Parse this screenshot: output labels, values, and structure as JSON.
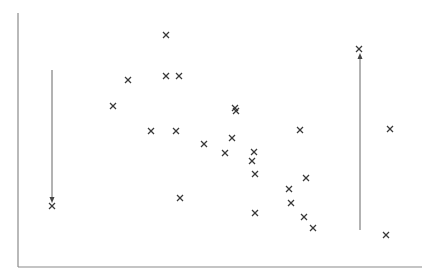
{
  "chart_data": {
    "type": "scatter",
    "title": "",
    "xlabel": "",
    "ylabel": "",
    "grid": false,
    "legend": null,
    "marker": "x",
    "marker_color": "#3a3a3a",
    "axis_color": "#8a8a8a",
    "pixel_frame": {
      "x_axis_y": 267,
      "y_axis_x": 18,
      "y_axis_top": 13,
      "x_axis_right": 422
    },
    "points": [
      {
        "x": 166,
        "y": 35
      },
      {
        "x": 128,
        "y": 80
      },
      {
        "x": 166,
        "y": 76
      },
      {
        "x": 179,
        "y": 76
      },
      {
        "x": 113,
        "y": 106
      },
      {
        "x": 235,
        "y": 108
      },
      {
        "x": 236,
        "y": 111
      },
      {
        "x": 151,
        "y": 131
      },
      {
        "x": 176,
        "y": 131
      },
      {
        "x": 232,
        "y": 138
      },
      {
        "x": 204,
        "y": 144
      },
      {
        "x": 225,
        "y": 153
      },
      {
        "x": 254,
        "y": 152
      },
      {
        "x": 252,
        "y": 161
      },
      {
        "x": 255,
        "y": 174
      },
      {
        "x": 306,
        "y": 178
      },
      {
        "x": 180,
        "y": 198
      },
      {
        "x": 289,
        "y": 189
      },
      {
        "x": 291,
        "y": 203
      },
      {
        "x": 255,
        "y": 213
      },
      {
        "x": 304,
        "y": 217
      },
      {
        "x": 313,
        "y": 228
      },
      {
        "x": 300,
        "y": 130
      },
      {
        "x": 390,
        "y": 129
      },
      {
        "x": 359,
        "y": 49
      },
      {
        "x": 52,
        "y": 206
      },
      {
        "x": 386,
        "y": 235
      }
    ],
    "annotations": [
      {
        "type": "arrow",
        "direction": "down",
        "x": 52,
        "y_start": 70,
        "y_end": 199,
        "target_point": [
          52,
          206
        ]
      },
      {
        "type": "arrow",
        "direction": "up",
        "x": 360,
        "y_start": 230,
        "y_end": 57,
        "target_point": [
          359,
          49
        ]
      }
    ]
  }
}
